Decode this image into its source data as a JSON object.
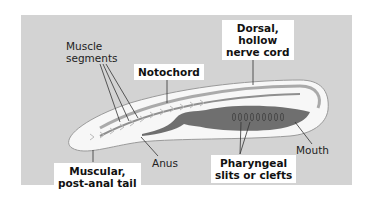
{
  "labels": {
    "muscle_segments": [
      "Muscle",
      "segments"
    ],
    "notochord": "Notochord",
    "dorsal_nerve_cord": [
      "Dorsal,",
      "hollow",
      "nerve cord"
    ],
    "anus": "Anus",
    "mouth": "Mouth",
    "muscular_tail": [
      "Muscular,",
      "post-anal tail"
    ],
    "pharyngeal_slits": [
      "Pharyngeal",
      "slits or clefts"
    ]
  },
  "colors": {
    "background": "#d3d3d3",
    "body": "#f7f7f7",
    "gut": "#6f6f6f",
    "lines": "#333333"
  }
}
